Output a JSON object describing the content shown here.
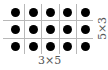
{
  "diagram": {
    "rows": 3,
    "cols": 5,
    "dot_color": "#000000",
    "grid_color": "#b8b8b8",
    "label_bottom": "3×5",
    "label_right": "5×3"
  }
}
